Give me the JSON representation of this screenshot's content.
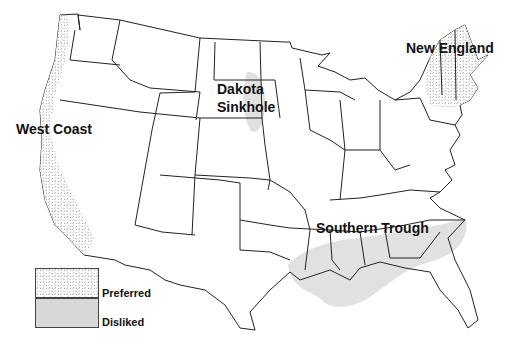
{
  "map": {
    "type": "choropleth",
    "subject": "United States (contiguous) regional preference map",
    "regions": [
      {
        "name": "West Coast",
        "category": "Preferred"
      },
      {
        "name": "New England",
        "category": "Preferred"
      },
      {
        "name": "Dakota Sinkhole",
        "category": "Disliked"
      },
      {
        "name": "Southern Trough",
        "category": "Disliked"
      }
    ]
  },
  "labels": {
    "west_coast": "West Coast",
    "new_england": "New England",
    "dakota_line1": "Dakota",
    "dakota_line2": "Sinkhole",
    "southern_trough": "Southern Trough"
  },
  "legend": {
    "items": [
      {
        "label": "Preferred",
        "pattern": "speckle-dash"
      },
      {
        "label": "Disliked",
        "pattern": "light-gray-fill"
      }
    ]
  },
  "colors": {
    "outline": "#222222",
    "preferred_fill": "#ffffff",
    "preferred_mark": "#555555",
    "disliked_fill": "#d8d8d8"
  }
}
